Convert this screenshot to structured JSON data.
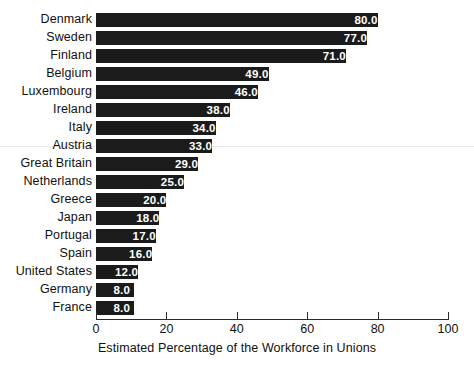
{
  "chart_data": {
    "type": "bar",
    "orientation": "horizontal",
    "title": "",
    "xlabel": "Estimated Percentage of the Workforce in Unions",
    "ylabel": "",
    "xlim": [
      0,
      100
    ],
    "xticks": [
      0,
      20,
      40,
      60,
      80,
      100
    ],
    "xtick_labels": [
      "0",
      "20",
      "40",
      "60",
      "80",
      "100"
    ],
    "grid": false,
    "legend": false,
    "bar_color": "#1b1b1b",
    "value_label_color": "#ffffff",
    "value_label_format": "one-decimal",
    "categories": [
      "Denmark",
      "Sweden",
      "Finland",
      "Belgium",
      "Luxembourg",
      "Ireland",
      "Italy",
      "Austria",
      "Great Britain",
      "Netherlands",
      "Greece",
      "Japan",
      "Portugal",
      "Spain",
      "United States",
      "Germany",
      "France"
    ],
    "values": [
      80.0,
      77.0,
      71.0,
      49.0,
      46.0,
      38.0,
      34.0,
      33.0,
      29.0,
      25.0,
      20.0,
      18.0,
      17.0,
      16.0,
      12.0,
      8.0,
      8.0
    ],
    "value_labels": [
      "80.0",
      "77.0",
      "71.0",
      "49.0",
      "46.0",
      "38.0",
      "34.0",
      "33.0",
      "29.0",
      "25.0",
      "20.0",
      "18.0",
      "17.0",
      "16.0",
      "12.0",
      "8.0",
      "8.0"
    ]
  }
}
